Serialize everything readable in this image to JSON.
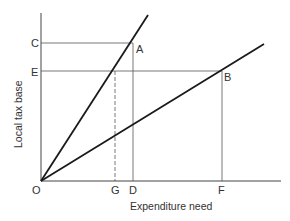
{
  "diagram": {
    "type": "economic-diagram",
    "x_axis_title": "Expenditure need",
    "y_axis_title": "Local tax base",
    "origin_label": "O",
    "y_labels": {
      "C": "C",
      "E": "E"
    },
    "x_labels": {
      "G": "G",
      "D": "D",
      "F": "F"
    },
    "point_labels": {
      "A": "A",
      "B": "B"
    },
    "lines": [
      {
        "name": "steep-line",
        "from": "O",
        "through": "A"
      },
      {
        "name": "shallow-line",
        "from": "O",
        "through": "B"
      }
    ],
    "guides": [
      {
        "name": "C-to-A",
        "style": "solid"
      },
      {
        "name": "A-to-D",
        "style": "solid"
      },
      {
        "name": "E-to-B",
        "style": "solid"
      },
      {
        "name": "B-to-F",
        "style": "solid"
      },
      {
        "name": "E-intersect-to-G",
        "style": "dashed"
      }
    ],
    "colors": {
      "line": "#1a1a1a",
      "guide": "#555555",
      "text": "#333333"
    }
  }
}
